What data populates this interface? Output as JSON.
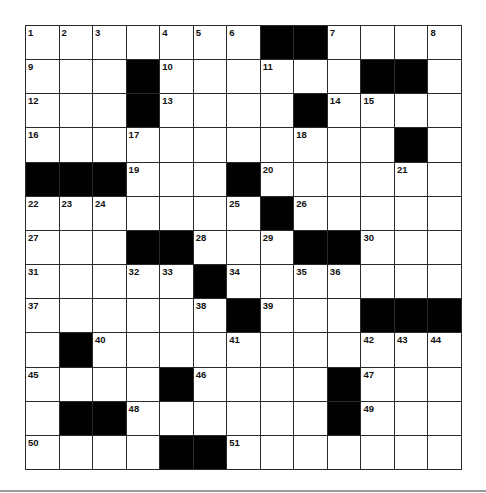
{
  "puzzle": {
    "rows": 13,
    "cols": 13,
    "grid": [
      [
        "1",
        "2",
        "3",
        "",
        "4",
        "5",
        "6",
        "#",
        "#",
        "7",
        "",
        "",
        "8"
      ],
      [
        "9",
        "",
        "",
        "#",
        "10",
        "",
        "",
        "11",
        "",
        "",
        "#",
        "#",
        ""
      ],
      [
        "12",
        "",
        "",
        "#",
        "13",
        "",
        "",
        "",
        "#",
        "14",
        "15",
        "",
        ""
      ],
      [
        "16",
        "",
        "",
        "17",
        "",
        "",
        "",
        "",
        "18",
        "",
        "",
        "#",
        ""
      ],
      [
        "#",
        "#",
        "#",
        "19",
        "",
        "",
        "#",
        "20",
        "",
        "",
        "",
        "21",
        ""
      ],
      [
        "22",
        "23",
        "24",
        "",
        "",
        "",
        "25",
        "#",
        "26",
        "",
        "",
        "",
        ""
      ],
      [
        "27",
        "",
        "",
        "#",
        "#",
        "28",
        "",
        "29",
        "#",
        "#",
        "30",
        "",
        ""
      ],
      [
        "31",
        "",
        "",
        "32",
        "33",
        "#",
        "34",
        "",
        "35",
        "36",
        "",
        "",
        ""
      ],
      [
        "37",
        "",
        "",
        "",
        "",
        "38",
        "#",
        "39",
        "",
        "",
        "#",
        "#",
        "#"
      ],
      [
        "",
        "#",
        "40",
        "",
        "",
        "",
        "41",
        "",
        "",
        "",
        "42",
        "43",
        "44"
      ],
      [
        "45",
        "",
        "",
        "",
        "#",
        "46",
        "",
        "",
        "",
        "#",
        "47",
        "",
        ""
      ],
      [
        "",
        "#",
        "#",
        "48",
        "",
        "",
        "",
        "",
        "",
        "#",
        "49",
        "",
        ""
      ],
      [
        "50",
        "",
        "",
        "",
        "#",
        "#",
        "51",
        "",
        "",
        "",
        "",
        "",
        ""
      ]
    ],
    "entries": [],
    "colors": {
      "block": "#000000",
      "cell": "#ffffff",
      "line": "#2a2a2a",
      "rule": "#9a9a9a"
    }
  }
}
